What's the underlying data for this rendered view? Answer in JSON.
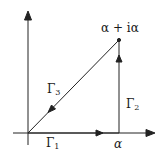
{
  "diagram": {
    "type": "contour-complex-plane",
    "colors": {
      "stroke": "#222222",
      "background": "#ffffff"
    },
    "points": {
      "origin": {
        "x": 28,
        "y": 133
      },
      "alpha": {
        "x": 119,
        "y": 133
      },
      "apex": {
        "x": 119,
        "y": 40
      }
    },
    "labels": {
      "apex": "α + iα",
      "alpha": "α",
      "gamma1": "Γ",
      "gamma1_sub": "1",
      "gamma2": "Γ",
      "gamma2_sub": "2",
      "gamma3": "Γ",
      "gamma3_sub": "3"
    },
    "segments": [
      {
        "name": "Γ1",
        "from": "origin",
        "to": "alpha",
        "direction": "right"
      },
      {
        "name": "Γ2",
        "from": "alpha",
        "to": "apex",
        "direction": "up"
      },
      {
        "name": "Γ3",
        "from": "apex",
        "to": "origin",
        "direction": "down-left"
      }
    ]
  }
}
